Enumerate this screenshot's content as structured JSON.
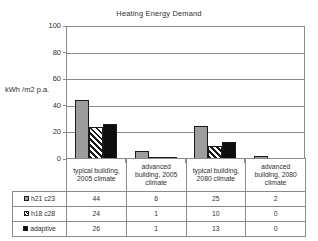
{
  "chart_data": {
    "type": "bar",
    "title": "Heating Energy Demand",
    "xlabel": "",
    "ylabel": "kWh /m2 p.a.",
    "ylim": [
      0,
      100
    ],
    "yticks": [
      0,
      20,
      40,
      60,
      80,
      100
    ],
    "grid": true,
    "legend_position": "table-below",
    "categories": [
      "typical building, 2005 climate",
      "advanced building, 2005 climate",
      "typical building, 2080 climate",
      "advanced building, 2080 climate"
    ],
    "series": [
      {
        "name": "h21 c23",
        "values": [
          44,
          6,
          25,
          2
        ],
        "color": "#9d9d9d",
        "fill": "solid-gray"
      },
      {
        "name": "h18 c28",
        "values": [
          24,
          1,
          10,
          0
        ],
        "color": "#ffffff",
        "fill": "diagonal-hatch"
      },
      {
        "name": "adaptive",
        "values": [
          26,
          1,
          13,
          0
        ],
        "color": "#0d0d0d",
        "fill": "solid-black"
      }
    ]
  },
  "axis": {
    "y_label": "kWh /m2 p.a.",
    "ticks": [
      {
        "label": "100"
      },
      {
        "label": "80"
      },
      {
        "label": "60"
      },
      {
        "label": "40"
      },
      {
        "label": "20"
      },
      {
        "label": "0"
      }
    ]
  },
  "table": {
    "headers": [
      "typical building, 2005 climate",
      "advanced building, 2005 climate",
      "typical building, 2080 climate",
      "advanced building, 2080 climate"
    ],
    "rows": [
      {
        "legend": "h21 c23",
        "values": [
          "44",
          "6",
          "25",
          "2"
        ]
      },
      {
        "legend": "h18 c28",
        "values": [
          "24",
          "1",
          "10",
          "0"
        ]
      },
      {
        "legend": "adaptive",
        "values": [
          "26",
          "1",
          "13",
          "0"
        ]
      }
    ]
  }
}
